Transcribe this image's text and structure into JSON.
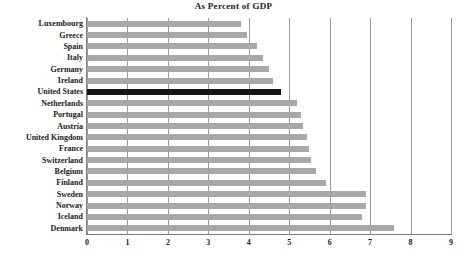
{
  "chart_data": {
    "type": "bar",
    "orientation": "horizontal",
    "title": "As Percent of GDP",
    "subtitle": "",
    "xlabel": "",
    "ylabel": "",
    "xlim": [
      0,
      9
    ],
    "xticks": [
      0,
      1,
      2,
      3,
      4,
      5,
      6,
      7,
      8,
      9
    ],
    "xtick_labels": [
      "0",
      "1",
      "2",
      "3",
      "4",
      "5",
      "6",
      "7",
      "8",
      "9"
    ],
    "grid": "vertical",
    "legend": "none",
    "categories": [
      "Luxembourg",
      "Greece",
      "Spain",
      "Italy",
      "Germany",
      "Ireland",
      "United States",
      "Netherlands",
      "Portugal",
      "Austria",
      "United Kingdom",
      "France",
      "Switzerland",
      "Belgium",
      "Finland",
      "Sweden",
      "Norway",
      "Iceland",
      "Denmark"
    ],
    "values": [
      3.8,
      3.95,
      4.2,
      4.35,
      4.5,
      4.6,
      4.8,
      5.2,
      5.3,
      5.35,
      5.45,
      5.5,
      5.55,
      5.65,
      5.9,
      6.9,
      6.9,
      6.8,
      7.6
    ],
    "bars": [
      {
        "label": "Luxembourg",
        "value": 3.8,
        "highlight": false
      },
      {
        "label": "Greece",
        "value": 3.95,
        "highlight": false
      },
      {
        "label": "Spain",
        "value": 4.2,
        "highlight": false
      },
      {
        "label": "Italy",
        "value": 4.35,
        "highlight": false
      },
      {
        "label": "Germany",
        "value": 4.5,
        "highlight": false
      },
      {
        "label": "Ireland",
        "value": 4.6,
        "highlight": false
      },
      {
        "label": "United States",
        "value": 4.8,
        "highlight": true
      },
      {
        "label": "Netherlands",
        "value": 5.2,
        "highlight": false
      },
      {
        "label": "Portugal",
        "value": 5.3,
        "highlight": false
      },
      {
        "label": "Austria",
        "value": 5.35,
        "highlight": false
      },
      {
        "label": "United Kingdom",
        "value": 5.45,
        "highlight": false
      },
      {
        "label": "France",
        "value": 5.5,
        "highlight": false
      },
      {
        "label": "Switzerland",
        "value": 5.55,
        "highlight": false
      },
      {
        "label": "Belgium",
        "value": 5.65,
        "highlight": false
      },
      {
        "label": "Finland",
        "value": 5.9,
        "highlight": false
      },
      {
        "label": "Sweden",
        "value": 6.9,
        "highlight": false
      },
      {
        "label": "Norway",
        "value": 6.9,
        "highlight": false
      },
      {
        "label": "Iceland",
        "value": 6.8,
        "highlight": false
      },
      {
        "label": "Denmark",
        "value": 7.6,
        "highlight": false
      }
    ],
    "colors": {
      "bar": "#a8a8a8",
      "bar_highlight": "#141414",
      "gridline": "#9a9a9a",
      "axis": "#7d7d7d",
      "text": "#1c1a18",
      "background": "#ffffff"
    }
  }
}
